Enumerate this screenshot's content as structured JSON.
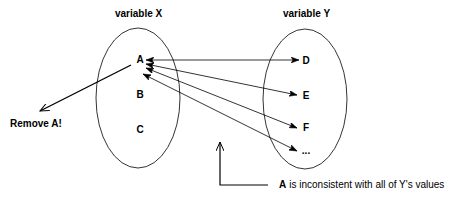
{
  "diagram": {
    "variable_x": {
      "title": "variable X",
      "values": [
        "A",
        "B",
        "C"
      ]
    },
    "variable_y": {
      "title": "variable Y",
      "values": [
        "D",
        "E",
        "F",
        "..."
      ]
    },
    "edges": [
      {
        "from": "A",
        "to": "D",
        "direction": "both"
      },
      {
        "from": "A",
        "to": "E",
        "direction": "both"
      },
      {
        "from": "A",
        "to": "F",
        "direction": "both"
      },
      {
        "from": "A",
        "to": "...",
        "direction": "both"
      }
    ],
    "action_label": "Remove A!",
    "annotation": {
      "emphasis": "A",
      "text": "is inconsistent with all of Y's values"
    },
    "colors": {
      "stroke": "#000000",
      "background": "#ffffff"
    }
  }
}
